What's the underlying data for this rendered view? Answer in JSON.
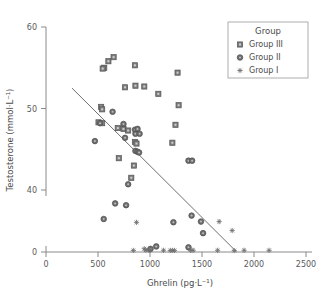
{
  "chart_data": {
    "type": "scatter",
    "title": "",
    "xlabel": "Ghrelin (pg·L⁻¹)",
    "ylabel": "Testosterone (mmol·L⁻¹)",
    "xlim": [
      0,
      2500
    ],
    "ylim": [
      0,
      60
    ],
    "xticks": [
      0,
      500,
      1000,
      1500,
      2000,
      2500
    ],
    "xticklabels": [
      "0",
      "500",
      "1000",
      "1500",
      "2000",
      "2500"
    ],
    "yticks": [
      0,
      40,
      50,
      60
    ],
    "yticklabels": [
      "0",
      "40",
      "50",
      "60"
    ],
    "y_axis_break": true,
    "grid": false,
    "legend": {
      "title": "Group",
      "position": "top-right",
      "entries": [
        {
          "name": "Group III",
          "marker": "square",
          "color": "#7b7b7b"
        },
        {
          "name": "Group II",
          "marker": "circle",
          "color": "#6e6e6e"
        },
        {
          "name": "Group I",
          "marker": "asterisk",
          "color": "#6e6e6e"
        }
      ]
    },
    "regression_line": {
      "x": [
        250,
        1830
      ],
      "y": [
        52.5,
        0.3
      ]
    },
    "series": [
      {
        "name": "Group III",
        "marker": "square",
        "points": [
          [
            560,
            55.0
          ],
          [
            600,
            55.8
          ],
          [
            650,
            56.3
          ],
          [
            545,
            54.9
          ],
          [
            855,
            55.3
          ],
          [
            1265,
            54.4
          ],
          [
            760,
            52.6
          ],
          [
            860,
            52.8
          ],
          [
            945,
            52.7
          ],
          [
            1080,
            51.8
          ],
          [
            1275,
            50.4
          ],
          [
            530,
            50.2
          ],
          [
            540,
            49.9
          ],
          [
            505,
            48.3
          ],
          [
            540,
            48.2
          ],
          [
            1245,
            48.0
          ],
          [
            690,
            47.6
          ],
          [
            745,
            47.5
          ],
          [
            790,
            47.3
          ],
          [
            855,
            45.9
          ],
          [
            870,
            45.7
          ],
          [
            1215,
            45.8
          ],
          [
            700,
            43.9
          ],
          [
            845,
            43.0
          ],
          [
            820,
            41.5
          ]
        ]
      },
      {
        "name": "Group II",
        "marker": "circle",
        "points": [
          [
            640,
            49.6
          ],
          [
            855,
            47.4
          ],
          [
            880,
            47.5
          ],
          [
            860,
            46.9
          ],
          [
            900,
            46.9
          ],
          [
            760,
            46.4
          ],
          [
            745,
            48.1
          ],
          [
            520,
            48.2
          ],
          [
            470,
            46.0
          ],
          [
            860,
            44.8
          ],
          [
            880,
            44.7
          ],
          [
            895,
            44.6
          ],
          [
            1370,
            43.6
          ],
          [
            1405,
            43.6
          ],
          [
            790,
            40.7
          ],
          [
            665,
            37.4
          ],
          [
            770,
            36.0
          ],
          [
            1400,
            28.0
          ],
          [
            555,
            25.4
          ],
          [
            1225,
            22.9
          ],
          [
            1490,
            23.4
          ],
          [
            1510,
            14.5
          ],
          [
            1060,
            4.3
          ],
          [
            1370,
            3.6
          ],
          [
            1005,
            2.4
          ]
        ]
      },
      {
        "name": "Group I",
        "marker": "asterisk",
        "points": [
          [
            840,
            1.2
          ],
          [
            960,
            1.4
          ],
          [
            985,
            1.6
          ],
          [
            1000,
            1.4
          ],
          [
            945,
            2.5
          ],
          [
            1130,
            1.3
          ],
          [
            1195,
            1.2
          ],
          [
            1215,
            1.2
          ],
          [
            1235,
            1.2
          ],
          [
            1390,
            1.3
          ],
          [
            1415,
            1.3
          ],
          [
            1650,
            1.3
          ],
          [
            1810,
            1.1
          ],
          [
            1905,
            1.3
          ],
          [
            2145,
            1.3
          ],
          [
            870,
            22.8
          ],
          [
            1665,
            23.4
          ],
          [
            1790,
            16.5
          ]
        ]
      }
    ]
  }
}
